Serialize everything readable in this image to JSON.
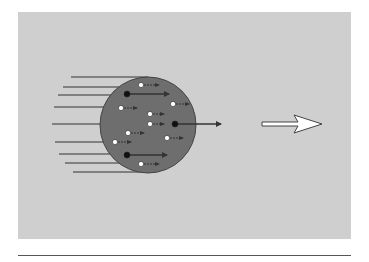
{
  "figure": {
    "background": "#cfcfcf",
    "body_color": "#6e6e6e",
    "line_color": "#333333",
    "circle": {
      "cx": 148,
      "cy": 125,
      "r": 48
    },
    "incoming_lines": [
      {
        "x1": 71,
        "y": 77,
        "x2": 148
      },
      {
        "x1": 63,
        "y": 87,
        "x2": 122
      },
      {
        "x1": 58,
        "y": 95,
        "x2": 112
      },
      {
        "x1": 54,
        "y": 107,
        "x2": 104
      },
      {
        "x1": 52,
        "y": 124,
        "x2": 100
      },
      {
        "x1": 55,
        "y": 142,
        "x2": 104
      },
      {
        "x1": 59,
        "y": 154,
        "x2": 110
      },
      {
        "x1": 65,
        "y": 163,
        "x2": 122
      },
      {
        "x1": 73,
        "y": 172,
        "x2": 140
      }
    ],
    "particles": [
      {
        "type": "light",
        "x": 141,
        "y": 85,
        "len": 18
      },
      {
        "type": "heavy",
        "x": 127,
        "y": 94,
        "len": 42
      },
      {
        "type": "light",
        "x": 173,
        "y": 104,
        "len": 16
      },
      {
        "type": "light",
        "x": 121,
        "y": 108,
        "len": 16
      },
      {
        "type": "light",
        "x": 150,
        "y": 114,
        "len": 14
      },
      {
        "type": "light",
        "x": 150,
        "y": 124,
        "len": 14
      },
      {
        "type": "heavy",
        "x": 175,
        "y": 124,
        "len": 46
      },
      {
        "type": "light",
        "x": 128,
        "y": 133,
        "len": 16
      },
      {
        "type": "light",
        "x": 167,
        "y": 138,
        "len": 16
      },
      {
        "type": "light",
        "x": 115,
        "y": 142,
        "len": 16
      },
      {
        "type": "heavy",
        "x": 127,
        "y": 155,
        "len": 40
      },
      {
        "type": "light",
        "x": 141,
        "y": 164,
        "len": 18
      }
    ],
    "big_arrow": {
      "x": 262,
      "y": 124,
      "shaft_len": 36,
      "head_len": 24,
      "color": "#ffffff"
    }
  }
}
